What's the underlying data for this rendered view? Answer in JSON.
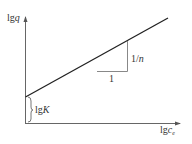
{
  "diagram": {
    "type": "freundlich-isotherm-log-plot",
    "colors": {
      "axis": "#555555",
      "line": "#222222",
      "triangle": "#777777",
      "text": "#333333"
    },
    "y_axis": {
      "label_main": "lg",
      "label_var": "q"
    },
    "x_axis": {
      "label_main": "lg",
      "label_var": "c",
      "label_sub": "e"
    },
    "intercept_label": {
      "main": "lg",
      "var": "K"
    },
    "slope_triangle": {
      "run_label": "1",
      "rise_label": "1/",
      "rise_var": "n"
    }
  }
}
